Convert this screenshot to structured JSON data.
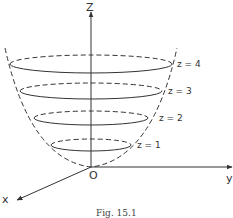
{
  "figure": {
    "caption": "Fig. 15.1",
    "axes": {
      "z_label": "Z",
      "y_label": "y",
      "x_label": "x",
      "origin_label": "O"
    },
    "surface": "paraboloid",
    "level_curves": [
      {
        "label": "z = 1",
        "z": 1
      },
      {
        "label": "z = 2",
        "z": 2
      },
      {
        "label": "z = 3",
        "z": 3
      },
      {
        "label": "z = 4",
        "z": 4
      }
    ],
    "colors": {
      "line": "#333333",
      "background": "#ffffff"
    }
  }
}
